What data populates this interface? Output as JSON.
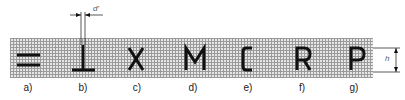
{
  "figure": {
    "labels": [
      "a)",
      "b)",
      "c)",
      "d)",
      "e)",
      "f)",
      "g)"
    ],
    "glyphs": [
      "=",
      "⊥",
      "X",
      "M",
      "C",
      "R",
      "P"
    ],
    "dimensions": {
      "stroke_width_label": "d'",
      "height_label": "h"
    }
  }
}
